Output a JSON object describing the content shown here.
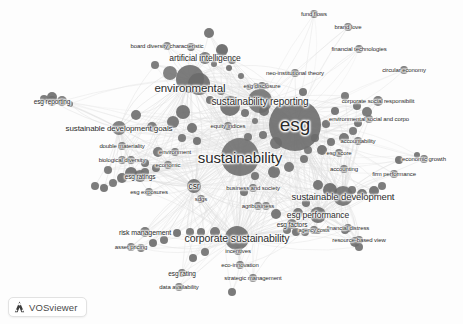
{
  "app": {
    "name": "VOSviewer",
    "logo_icon": "vosviewer-triangle-icon",
    "logo_label": "VOSviewer",
    "background_color": "#fdfdfd",
    "canvas_width": 463,
    "canvas_height": 324
  },
  "chart_data": {
    "type": "scatter",
    "title": "",
    "xlabel": "",
    "ylabel": "",
    "grid": false,
    "legend_position": "none",
    "node_color": "#6f6f6f",
    "link_color": "#d8d8d8",
    "label_color": "#2b2b2b",
    "xlim": [
      0,
      463
    ],
    "ylim": [
      0,
      324
    ],
    "nodes": [
      {
        "label": "esg",
        "x": 295,
        "y": 125,
        "r": 26,
        "font": 19,
        "shade": "#6b6b6b",
        "label_dx": 0,
        "label_dy": 0
      },
      {
        "label": "sustainability",
        "x": 240,
        "y": 157,
        "r": 19,
        "font": 15,
        "shade": "#707070",
        "label_dx": 0,
        "label_dy": 0
      },
      {
        "label": "environmental",
        "x": 190,
        "y": 79,
        "r": 14,
        "font": 11.5,
        "shade": "#6e6e6e",
        "label_dx": 0,
        "label_dy": 9
      },
      {
        "label": "sustainability reporting",
        "x": 260,
        "y": 101,
        "r": 12,
        "font": 10,
        "shade": "#727272",
        "label_dx": 0,
        "label_dy": 0
      },
      {
        "label": "corporate sustainability",
        "x": 237,
        "y": 238,
        "r": 12,
        "font": 10.5,
        "shade": "#6d6d6d",
        "label_dx": 0,
        "label_dy": 0
      },
      {
        "label": "sustainable development",
        "x": 343,
        "y": 196,
        "r": 10,
        "font": 9.5,
        "shade": "#6f6f6f",
        "label_dx": 0,
        "label_dy": 0
      },
      {
        "label": "esg performance",
        "x": 318,
        "y": 215,
        "r": 8,
        "font": 8.5,
        "shade": "#6a6a6a",
        "label_dx": 0,
        "label_dy": 0
      },
      {
        "label": "sustainable development goals",
        "x": 119,
        "y": 128,
        "r": 7,
        "font": 8,
        "shade": "#767676",
        "label_dx": 0,
        "label_dy": 0
      },
      {
        "label": "csr",
        "x": 194,
        "y": 186,
        "r": 7,
        "font": 8.5,
        "shade": "#6c6c6c",
        "label_dx": 0,
        "label_dy": 0
      },
      {
        "label": "esg reporting",
        "x": 52,
        "y": 101,
        "r": 5,
        "font": 6.5,
        "shade": "#6f6f6f",
        "label_dx": 0,
        "label_dy": 0
      },
      {
        "label": "artificial intelligence",
        "x": 205,
        "y": 58,
        "r": 6,
        "font": 8.5,
        "shade": "#6b6b6b",
        "label_dx": 0,
        "label_dy": 0
      },
      {
        "label": "board diversity characteristic",
        "x": 167,
        "y": 46,
        "r": 4,
        "font": 6,
        "shade": "#737373",
        "label_dx": 0,
        "label_dy": 0
      },
      {
        "label": "neo-institutional theory",
        "x": 295,
        "y": 73,
        "r": 4,
        "font": 6,
        "shade": "#717171",
        "label_dx": 0,
        "label_dy": 0
      },
      {
        "label": "esg disclosure",
        "x": 262,
        "y": 86,
        "r": 4,
        "font": 6,
        "shade": "#6e6e6e",
        "label_dx": 0,
        "label_dy": 0
      },
      {
        "label": "fund flows",
        "x": 314,
        "y": 14,
        "r": 4,
        "font": 6,
        "shade": "#707070",
        "label_dx": 0,
        "label_dy": 0
      },
      {
        "label": "brand love",
        "x": 348,
        "y": 27,
        "r": 4,
        "font": 6,
        "shade": "#6d6d6d",
        "label_dx": 0,
        "label_dy": 0
      },
      {
        "label": "financial technologies",
        "x": 359,
        "y": 49,
        "r": 4,
        "font": 6,
        "shade": "#6f6f6f",
        "label_dx": 0,
        "label_dy": 0
      },
      {
        "label": "circular economy",
        "x": 404,
        "y": 70,
        "r": 4,
        "font": 6,
        "shade": "#6c6c6c",
        "label_dx": 0,
        "label_dy": 0
      },
      {
        "label": "corporate social responsibilit",
        "x": 378,
        "y": 101,
        "r": 5,
        "font": 6,
        "shade": "#6e6e6e",
        "label_dx": 0,
        "label_dy": 0
      },
      {
        "label": "environmental social and corpo",
        "x": 369,
        "y": 119,
        "r": 4,
        "font": 6,
        "shade": "#737373",
        "label_dx": 0,
        "label_dy": 0
      },
      {
        "label": "accountability",
        "x": 358,
        "y": 141,
        "r": 4,
        "font": 6,
        "shade": "#707070",
        "label_dx": 0,
        "label_dy": 0
      },
      {
        "label": "esg score",
        "x": 339,
        "y": 153,
        "r": 4,
        "font": 6,
        "shade": "#6b6b6b",
        "label_dx": 0,
        "label_dy": 0
      },
      {
        "label": "accounting",
        "x": 344,
        "y": 169,
        "r": 4,
        "font": 6,
        "shade": "#6f6f6f",
        "label_dx": 0,
        "label_dy": 0
      },
      {
        "label": "economic growth",
        "x": 424,
        "y": 159,
        "r": 4,
        "font": 6,
        "shade": "#6d6d6d",
        "label_dx": 0,
        "label_dy": 0
      },
      {
        "label": "firm performance",
        "x": 394,
        "y": 174,
        "r": 4,
        "font": 6,
        "shade": "#717171",
        "label_dx": 0,
        "label_dy": 0
      },
      {
        "label": "financial distress",
        "x": 348,
        "y": 228,
        "r": 4,
        "font": 6,
        "shade": "#6e6e6e",
        "label_dx": 0,
        "label_dy": 0
      },
      {
        "label": "resource-based view",
        "x": 359,
        "y": 240,
        "r": 4,
        "font": 6,
        "shade": "#6c6c6c",
        "label_dx": 0,
        "label_dy": 0
      },
      {
        "label": "agency costs",
        "x": 314,
        "y": 230,
        "r": 4,
        "font": 5.5,
        "shade": "#6f6f6f",
        "label_dx": 0,
        "label_dy": 0
      },
      {
        "label": "esg factors",
        "x": 292,
        "y": 224,
        "r": 5,
        "font": 6.5,
        "shade": "#6a6a6a",
        "label_dx": 0,
        "label_dy": 0
      },
      {
        "label": "agribusiness",
        "x": 258,
        "y": 206,
        "r": 4,
        "font": 6,
        "shade": "#717171",
        "label_dx": 0,
        "label_dy": 0
      },
      {
        "label": "business and society",
        "x": 253,
        "y": 188,
        "r": 4,
        "font": 6,
        "shade": "#6e6e6e",
        "label_dx": 0,
        "label_dy": 0
      },
      {
        "label": "sdgs",
        "x": 201,
        "y": 199,
        "r": 4,
        "font": 6,
        "shade": "#6d6d6d",
        "label_dx": 0,
        "label_dy": 0
      },
      {
        "label": "esg exposures",
        "x": 149,
        "y": 192,
        "r": 4,
        "font": 6,
        "shade": "#707070",
        "label_dx": 0,
        "label_dy": 0
      },
      {
        "label": "esg ratings",
        "x": 140,
        "y": 176,
        "r": 6,
        "font": 6.5,
        "shade": "#6b6b6b",
        "label_dx": 0,
        "label_dy": 0
      },
      {
        "label": "biological diversity",
        "x": 122,
        "y": 160,
        "r": 4,
        "font": 6,
        "shade": "#737373",
        "label_dx": 0,
        "label_dy": 0
      },
      {
        "label": "double materiality",
        "x": 122,
        "y": 146,
        "r": 4,
        "font": 6,
        "shade": "#6f6f6f",
        "label_dx": 0,
        "label_dy": 0
      },
      {
        "label": "environment",
        "x": 175,
        "y": 152,
        "r": 4,
        "font": 6,
        "shade": "#6c6c6c",
        "label_dx": 0,
        "label_dy": 0
      },
      {
        "label": "economic",
        "x": 168,
        "y": 165,
        "r": 4,
        "font": 6,
        "shade": "#717171",
        "label_dx": 0,
        "label_dy": 0
      },
      {
        "label": "equity indices",
        "x": 228,
        "y": 126,
        "r": 4,
        "font": 6,
        "shade": "#6e6e6e",
        "label_dx": 0,
        "label_dy": 0
      },
      {
        "label": "risk management",
        "x": 145,
        "y": 232,
        "r": 5,
        "font": 7,
        "shade": "#6d6d6d",
        "label_dx": 0,
        "label_dy": 0
      },
      {
        "label": "asset pricing",
        "x": 131,
        "y": 247,
        "r": 4,
        "font": 6,
        "shade": "#707070",
        "label_dx": 0,
        "label_dy": 0
      },
      {
        "label": "esg rating",
        "x": 182,
        "y": 273,
        "r": 4,
        "font": 6.5,
        "shade": "#6a6a6a",
        "label_dx": 0,
        "label_dy": 0
      },
      {
        "label": "data availability",
        "x": 179,
        "y": 287,
        "r": 4,
        "font": 6,
        "shade": "#727272",
        "label_dx": 0,
        "label_dy": 0
      },
      {
        "label": "incentives",
        "x": 238,
        "y": 251,
        "r": 4,
        "font": 6,
        "shade": "#6f6f6f",
        "label_dx": 0,
        "label_dy": 0
      },
      {
        "label": "eco-innovation",
        "x": 240,
        "y": 265,
        "r": 4,
        "font": 6,
        "shade": "#6c6c6c",
        "label_dx": 0,
        "label_dy": 0
      },
      {
        "label": "strategic management",
        "x": 253,
        "y": 278,
        "r": 4,
        "font": 6,
        "shade": "#6e6e6e",
        "label_dx": 0,
        "label_dy": 0
      }
    ],
    "extra_nodes": [
      {
        "x": 209,
        "y": 33,
        "r": 5,
        "shade": "#6c6c6c"
      },
      {
        "x": 191,
        "y": 47,
        "r": 4,
        "shade": "#6f6f6f"
      },
      {
        "x": 222,
        "y": 50,
        "r": 6,
        "shade": "#646464"
      },
      {
        "x": 232,
        "y": 60,
        "r": 4,
        "shade": "#6d6d6d"
      },
      {
        "x": 214,
        "y": 64,
        "r": 3,
        "shade": "#737373"
      },
      {
        "x": 155,
        "y": 65,
        "r": 4,
        "shade": "#707070"
      },
      {
        "x": 170,
        "y": 73,
        "r": 7,
        "shade": "#757575"
      },
      {
        "x": 199,
        "y": 84,
        "r": 11,
        "shade": "#6a6a6a"
      },
      {
        "x": 221,
        "y": 91,
        "r": 4,
        "shade": "#6e6e6e"
      },
      {
        "x": 210,
        "y": 100,
        "r": 4,
        "shade": "#6d6d6d"
      },
      {
        "x": 230,
        "y": 106,
        "r": 10,
        "shade": "#6b6b6b"
      },
      {
        "x": 249,
        "y": 87,
        "r": 3,
        "shade": "#717171"
      },
      {
        "x": 256,
        "y": 86,
        "r": 3,
        "shade": "#6c6c6c"
      },
      {
        "x": 266,
        "y": 86,
        "r": 3,
        "shade": "#6f6f6f"
      },
      {
        "x": 245,
        "y": 113,
        "r": 4,
        "shade": "#6d6d6d"
      },
      {
        "x": 255,
        "y": 121,
        "r": 3,
        "shade": "#727272"
      },
      {
        "x": 264,
        "y": 111,
        "r": 5,
        "shade": "#6a6a6a"
      },
      {
        "x": 263,
        "y": 135,
        "r": 4,
        "shade": "#6e6e6e"
      },
      {
        "x": 248,
        "y": 137,
        "r": 4,
        "shade": "#717171"
      },
      {
        "x": 276,
        "y": 143,
        "r": 6,
        "shade": "#6b6b6b"
      },
      {
        "x": 255,
        "y": 176,
        "r": 4,
        "shade": "#6f6f6f"
      },
      {
        "x": 274,
        "y": 172,
        "r": 6,
        "shade": "#6c6c6c"
      },
      {
        "x": 289,
        "y": 167,
        "r": 5,
        "shade": "#707070"
      },
      {
        "x": 304,
        "y": 159,
        "r": 4,
        "shade": "#6d6d6d"
      },
      {
        "x": 322,
        "y": 150,
        "r": 5,
        "shade": "#6a6a6a"
      },
      {
        "x": 331,
        "y": 142,
        "r": 4,
        "shade": "#6e6e6e"
      },
      {
        "x": 344,
        "y": 138,
        "r": 5,
        "shade": "#6b6b6b"
      },
      {
        "x": 353,
        "y": 131,
        "r": 4,
        "shade": "#717171"
      },
      {
        "x": 358,
        "y": 123,
        "r": 4,
        "shade": "#6c6c6c"
      },
      {
        "x": 367,
        "y": 112,
        "r": 5,
        "shade": "#6f6f6f"
      },
      {
        "x": 357,
        "y": 106,
        "r": 4,
        "shade": "#6d6d6d"
      },
      {
        "x": 345,
        "y": 96,
        "r": 4,
        "shade": "#707070"
      },
      {
        "x": 335,
        "y": 111,
        "r": 4,
        "shade": "#6a6a6a"
      },
      {
        "x": 326,
        "y": 124,
        "r": 4,
        "shade": "#6e6e6e"
      },
      {
        "x": 315,
        "y": 138,
        "r": 4,
        "shade": "#6b6b6b"
      },
      {
        "x": 308,
        "y": 150,
        "r": 4,
        "shade": "#727272"
      },
      {
        "x": 318,
        "y": 185,
        "r": 5,
        "shade": "#6c6c6c"
      },
      {
        "x": 330,
        "y": 190,
        "r": 7,
        "shade": "#686868"
      },
      {
        "x": 352,
        "y": 190,
        "r": 4,
        "shade": "#6f6f6f"
      },
      {
        "x": 362,
        "y": 194,
        "r": 5,
        "shade": "#6d6d6d"
      },
      {
        "x": 374,
        "y": 191,
        "r": 5,
        "shade": "#6a6a6a"
      },
      {
        "x": 382,
        "y": 186,
        "r": 4,
        "shade": "#707070"
      },
      {
        "x": 306,
        "y": 203,
        "r": 4,
        "shade": "#6e6e6e"
      },
      {
        "x": 298,
        "y": 213,
        "r": 5,
        "shade": "#6b6b6b"
      },
      {
        "x": 287,
        "y": 230,
        "r": 4,
        "shade": "#717171"
      },
      {
        "x": 296,
        "y": 232,
        "r": 4,
        "shade": "#6c6c6c"
      },
      {
        "x": 305,
        "y": 232,
        "r": 4,
        "shade": "#6f6f6f"
      },
      {
        "x": 318,
        "y": 231,
        "r": 3,
        "shade": "#6d6d6d"
      },
      {
        "x": 345,
        "y": 230,
        "r": 4,
        "shade": "#6a6a6a"
      },
      {
        "x": 355,
        "y": 242,
        "r": 5,
        "shade": "#686868"
      },
      {
        "x": 359,
        "y": 247,
        "r": 4,
        "shade": "#6e6e6e"
      },
      {
        "x": 276,
        "y": 214,
        "r": 5,
        "shade": "#6b6b6b"
      },
      {
        "x": 266,
        "y": 206,
        "r": 4,
        "shade": "#717171"
      },
      {
        "x": 244,
        "y": 192,
        "r": 4,
        "shade": "#6c6c6c"
      },
      {
        "x": 215,
        "y": 232,
        "r": 5,
        "shade": "#6f6f6f"
      },
      {
        "x": 201,
        "y": 232,
        "r": 4,
        "shade": "#6d6d6d"
      },
      {
        "x": 190,
        "y": 232,
        "r": 4,
        "shade": "#707070"
      },
      {
        "x": 177,
        "y": 233,
        "r": 4,
        "shade": "#6a6a6a"
      },
      {
        "x": 164,
        "y": 240,
        "r": 4,
        "shade": "#6e6e6e"
      },
      {
        "x": 153,
        "y": 243,
        "r": 4,
        "shade": "#6b6b6b"
      },
      {
        "x": 141,
        "y": 248,
        "r": 4,
        "shade": "#727272"
      },
      {
        "x": 193,
        "y": 258,
        "r": 4,
        "shade": "#6c6c6c"
      },
      {
        "x": 205,
        "y": 252,
        "r": 4,
        "shade": "#6f6f6f"
      },
      {
        "x": 232,
        "y": 292,
        "r": 4,
        "shade": "#6d6d6d"
      },
      {
        "x": 122,
        "y": 178,
        "r": 5,
        "shade": "#6a6a6a"
      },
      {
        "x": 131,
        "y": 173,
        "r": 6,
        "shade": "#686868"
      },
      {
        "x": 145,
        "y": 172,
        "r": 4,
        "shade": "#6e6e6e"
      },
      {
        "x": 156,
        "y": 168,
        "r": 4,
        "shade": "#6b6b6b"
      },
      {
        "x": 113,
        "y": 183,
        "r": 4,
        "shade": "#717171"
      },
      {
        "x": 104,
        "y": 188,
        "r": 4,
        "shade": "#6c6c6c"
      },
      {
        "x": 95,
        "y": 186,
        "r": 4,
        "shade": "#6f6f6f"
      },
      {
        "x": 136,
        "y": 115,
        "r": 5,
        "shade": "#6d6d6d"
      },
      {
        "x": 152,
        "y": 127,
        "r": 5,
        "shade": "#707070"
      },
      {
        "x": 131,
        "y": 160,
        "r": 4,
        "shade": "#6a6a6a"
      },
      {
        "x": 44,
        "y": 99,
        "r": 4,
        "shade": "#6e6e6e"
      },
      {
        "x": 52,
        "y": 97,
        "r": 5,
        "shade": "#6b6b6b"
      },
      {
        "x": 62,
        "y": 101,
        "r": 5,
        "shade": "#717171"
      },
      {
        "x": 70,
        "y": 104,
        "r": 3,
        "shade": "#6c6c6c"
      },
      {
        "x": 183,
        "y": 112,
        "r": 7,
        "shade": "#6a6a6a"
      },
      {
        "x": 173,
        "y": 122,
        "r": 6,
        "shade": "#6e6e6e"
      },
      {
        "x": 192,
        "y": 128,
        "r": 5,
        "shade": "#6b6b6b"
      },
      {
        "x": 182,
        "y": 138,
        "r": 4,
        "shade": "#717171"
      },
      {
        "x": 197,
        "y": 141,
        "r": 4,
        "shade": "#6c6c6c"
      },
      {
        "x": 158,
        "y": 152,
        "r": 5,
        "shade": "#6f6f6f"
      },
      {
        "x": 145,
        "y": 163,
        "r": 4,
        "shade": "#6d6d6d"
      },
      {
        "x": 108,
        "y": 170,
        "r": 4,
        "shade": "#707070"
      },
      {
        "x": 399,
        "y": 160,
        "r": 4,
        "shade": "#6a6a6a"
      },
      {
        "x": 417,
        "y": 155,
        "r": 3,
        "shade": "#6e6e6e"
      },
      {
        "x": 229,
        "y": 68,
        "r": 3,
        "shade": "#6b6b6b"
      },
      {
        "x": 241,
        "y": 76,
        "r": 3,
        "shade": "#717171"
      },
      {
        "x": 303,
        "y": 92,
        "r": 4,
        "shade": "#6c6c6c"
      }
    ],
    "edges_note": "Faint light-gray curved links connect nodes radially through the dense ESG / sustainability core."
  }
}
